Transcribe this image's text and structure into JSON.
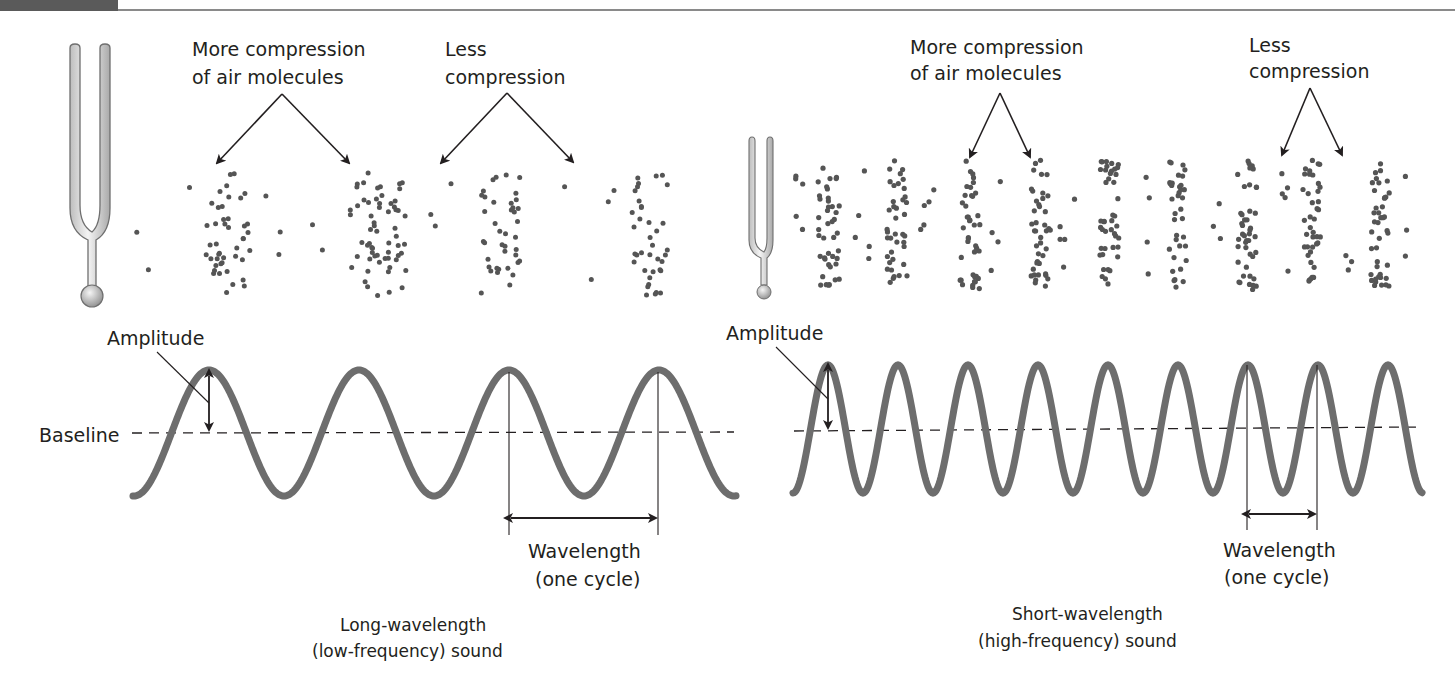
{
  "page_header": {
    "block_color": "#5a5a5a",
    "rule_color": "#8a8a8a"
  },
  "colors": {
    "wave": "#6d6d6d",
    "dot": "#555555",
    "ink": "#231f20",
    "fork_fill": "#e6e6e6",
    "fork_stroke": "#6f6f6f"
  },
  "left_panel": {
    "compression_label": [
      "More compression",
      "of air molecules"
    ],
    "rarefaction_label": [
      "Less",
      "compression"
    ],
    "amplitude_label": "Amplitude",
    "baseline_label": "Baseline",
    "wavelength_label": [
      "Wavelength",
      "(one cycle)"
    ],
    "caption": [
      "Long-wavelength",
      "(low-frequency) sound"
    ],
    "wave": {
      "x_start": 133,
      "x_end": 736,
      "baseline_y": 433,
      "amplitude": 63,
      "wavelength": 150,
      "first_peak_x": 209
    },
    "wavelength_marker": {
      "x1": 509,
      "x2": 658,
      "arrow_y": 518,
      "line_bottom": 535
    },
    "dot_clusters": [
      {
        "cx": 228,
        "spread": 22,
        "count": 44
      },
      {
        "cx": 378,
        "spread": 28,
        "count": 62
      },
      {
        "cx": 500,
        "spread": 20,
        "count": 40
      },
      {
        "cx": 650,
        "spread": 18,
        "count": 38
      }
    ],
    "sparse_dot_ranges": [
      [
        130,
        195
      ],
      [
        265,
        335
      ],
      [
        420,
        460
      ],
      [
        560,
        620
      ]
    ]
  },
  "right_panel": {
    "compression_label": [
      "More compression",
      "of air molecules"
    ],
    "rarefaction_label": [
      "Less",
      "compression"
    ],
    "amplitude_label": "Amplitude",
    "wavelength_label": [
      "Wavelength",
      "(one cycle)"
    ],
    "caption": [
      "Short-wavelength",
      "(high-frequency) sound"
    ],
    "wave": {
      "x_start": 793,
      "x_end": 1422,
      "baseline_y": 429,
      "amplitude": 64,
      "wavelength": 70,
      "first_peak_x": 828
    },
    "wavelength_marker": {
      "x1": 1247,
      "x2": 1317,
      "arrow_y": 514,
      "line_bottom": 530
    },
    "dot_clusters": [
      {
        "cx": 829,
        "spread": 11,
        "count": 42
      },
      {
        "cx": 897,
        "spread": 10,
        "count": 40
      },
      {
        "cx": 970,
        "spread": 10,
        "count": 42
      },
      {
        "cx": 1041,
        "spread": 10,
        "count": 42
      },
      {
        "cx": 1110,
        "spread": 10,
        "count": 44
      },
      {
        "cx": 1178,
        "spread": 9,
        "count": 36
      },
      {
        "cx": 1247,
        "spread": 10,
        "count": 44
      },
      {
        "cx": 1312,
        "spread": 9,
        "count": 40
      },
      {
        "cx": 1380,
        "spread": 10,
        "count": 42
      }
    ],
    "sparse_dot_ranges": [
      [
        795,
        805
      ],
      [
        855,
        870
      ],
      [
        920,
        935
      ],
      [
        990,
        1005
      ],
      [
        1060,
        1075
      ],
      [
        1140,
        1150
      ],
      [
        1205,
        1225
      ],
      [
        1275,
        1290
      ],
      [
        1340,
        1355
      ],
      [
        1405,
        1415
      ]
    ]
  },
  "arrows": [
    {
      "name": "left-more-compression",
      "apex": [
        282,
        94
      ],
      "tips": [
        [
          217,
          163
        ],
        [
          349,
          163
        ]
      ]
    },
    {
      "name": "left-less-compression",
      "apex": [
        507,
        93
      ],
      "tips": [
        [
          441,
          163
        ],
        [
          573,
          162
        ]
      ]
    },
    {
      "name": "right-more-compression",
      "apex": [
        1000,
        93
      ],
      "tips": [
        [
          970,
          157
        ],
        [
          1030,
          157
        ]
      ]
    },
    {
      "name": "right-less-compression",
      "apex": [
        1310,
        88
      ],
      "tips": [
        [
          1282,
          155
        ],
        [
          1342,
          155
        ]
      ]
    }
  ]
}
